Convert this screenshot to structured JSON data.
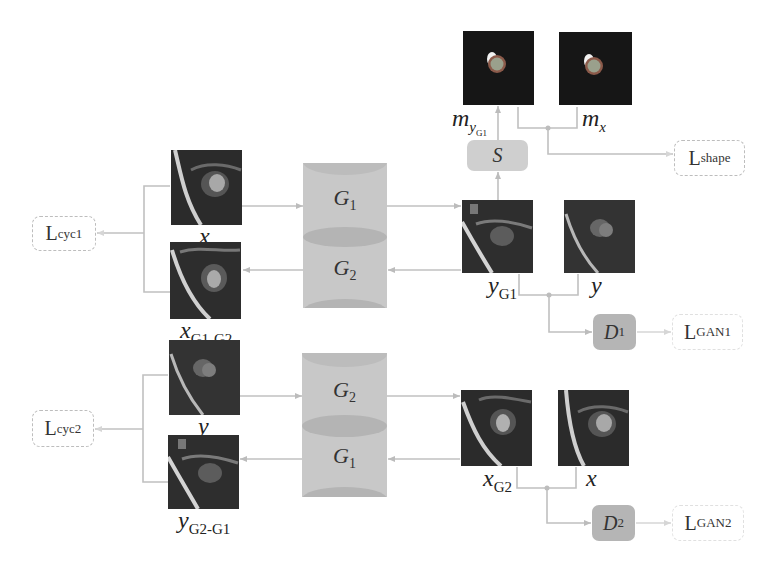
{
  "diagram": {
    "colors": {
      "wire": "#c0c0c0",
      "generator": "#c8c8c8",
      "discriminator": "#b5b5b5",
      "segmenter": "#cfcfcf",
      "loss_border": "#bdbdbd",
      "image_bg": "#2a2a2a"
    },
    "masks": {
      "m_yG1": {
        "base": "m",
        "sub": "y",
        "subsub": "G1"
      },
      "m_x": {
        "base": "m",
        "sub": "x"
      }
    },
    "segmenter": {
      "label": "S"
    },
    "losses": {
      "shape": {
        "base": "L",
        "sub": "shape"
      },
      "cyc1": {
        "base": "L",
        "sub": "cyc1"
      },
      "cyc2": {
        "base": "L",
        "sub": "cyc2"
      },
      "gan1": {
        "base": "L",
        "sub": "GAN1"
      },
      "gan2": {
        "base": "L",
        "sub": "GAN2"
      }
    },
    "generator_block_top": {
      "upper": {
        "base": "G",
        "sub": "1"
      },
      "lower": {
        "base": "G",
        "sub": "2"
      }
    },
    "generator_block_bottom": {
      "upper": {
        "base": "G",
        "sub": "2"
      },
      "lower": {
        "base": "G",
        "sub": "1"
      }
    },
    "discriminators": {
      "d1": {
        "base": "D",
        "sub": "1"
      },
      "d2": {
        "base": "D",
        "sub": "2"
      }
    },
    "images": {
      "x_top": {
        "base": "x",
        "sub": ""
      },
      "x_G1_G2": {
        "base": "x",
        "sub": "G1-G2"
      },
      "y_G1": {
        "base": "y",
        "sub": "G1"
      },
      "y_real_top": {
        "base": "y",
        "sub": ""
      },
      "y_bottom": {
        "base": "y",
        "sub": ""
      },
      "y_G2_G1": {
        "base": "y",
        "sub": "G2-G1"
      },
      "x_G2": {
        "base": "x",
        "sub": "G2"
      },
      "x_real_bottom": {
        "base": "x",
        "sub": ""
      }
    }
  }
}
